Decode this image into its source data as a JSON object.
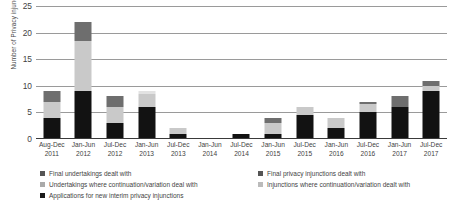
{
  "chart_data": {
    "type": "bar",
    "subtype": "stacked-vertical",
    "title": "",
    "xlabel": "",
    "ylabel": "Number of Privacy injunction proceedings",
    "ylim": [
      0,
      25
    ],
    "yticks": [
      0,
      5,
      10,
      15,
      20,
      25
    ],
    "grid": "horizontal",
    "legend_position": "bottom",
    "categories": [
      "Aug-Dec 2011",
      "Jan-Jun 2012",
      "Jul-Dec 2012",
      "Jan-Jun 2013",
      "Jul-Dec 2013",
      "Jan-Jun 2014",
      "Jul-Dec 2014",
      "Jan-Jun 2015",
      "Jul-Dec 2015",
      "Jan-Jun 2016",
      "Jul-Dec 2016",
      "Jan-Jun 2017",
      "Jul-Dec 2017"
    ],
    "category_lines": [
      [
        "Aug-Dec",
        "2011"
      ],
      [
        "Jan-Jun",
        "2012"
      ],
      [
        "Jul-Dec",
        "2012"
      ],
      [
        "Jan-Jun",
        "2013"
      ],
      [
        "Jul-Dec",
        "2013"
      ],
      [
        "Jan-Jun",
        "2014"
      ],
      [
        "Jul-Dec",
        "2014"
      ],
      [
        "Jan-Jun",
        "2015"
      ],
      [
        "Jul-Dec",
        "2015"
      ],
      [
        "Jan-Jun",
        "2016"
      ],
      [
        "Jul-Dec",
        "2016"
      ],
      [
        "Jan-Jun",
        "2017"
      ],
      [
        "Jul-Dec",
        "2017"
      ]
    ],
    "series": [
      {
        "name": "Applications for new interim privacy injunctions",
        "color": "#121212",
        "values": [
          4,
          9,
          3,
          6,
          1,
          0,
          1,
          1,
          4.5,
          2,
          5,
          6,
          9
        ]
      },
      {
        "name": "Injunctions where continuation/variation dealt with",
        "color": "#c9c9c9",
        "values": [
          3,
          9.5,
          3,
          2.5,
          1,
          0,
          0,
          2,
          1.5,
          2,
          1.5,
          0,
          1
        ]
      },
      {
        "name": "Undertakings where continuation/variation deal with",
        "color": "#e2e2e2",
        "values": [
          0,
          0,
          0,
          0.5,
          0,
          0,
          0,
          0,
          0,
          0,
          0,
          0,
          0
        ]
      },
      {
        "name": "Final privacy injunctions dealt with",
        "color": "#6e6e6e",
        "values": [
          2,
          3.5,
          2,
          0,
          0,
          0,
          0,
          1,
          0,
          0,
          0.5,
          2,
          1
        ]
      },
      {
        "name": "Final undertakings dealt with",
        "color": "#8e8e8e",
        "values": [
          0,
          0,
          0,
          0,
          0,
          0,
          0,
          0,
          0,
          0,
          0,
          0,
          0
        ]
      }
    ],
    "totals": [
      9,
      22,
      8,
      9,
      2,
      0,
      1,
      4,
      6,
      4,
      7,
      8,
      11
    ]
  },
  "legend": {
    "items": [
      {
        "label": "Final undertakings dealt with",
        "color": "#555555"
      },
      {
        "label": "Final privacy injunctions dealt with",
        "color": "#555555"
      },
      {
        "label": "Undertakings where continuation/variation deal with",
        "color": "#aaaaaa"
      },
      {
        "label": "Injunctions where continuation/variation dealt with",
        "color": "#bbbbbb"
      },
      {
        "label": "Applications for new interim privacy injunctions",
        "color": "#1a1a1a"
      }
    ]
  },
  "axis": {
    "y_title": "Number of Privacy injunction proceedings",
    "tick_labels": [
      "0",
      "5",
      "10",
      "15",
      "20",
      "25"
    ]
  }
}
